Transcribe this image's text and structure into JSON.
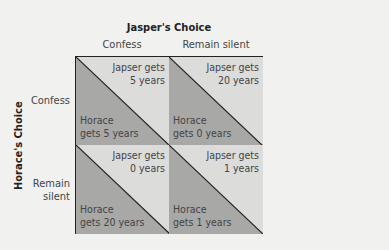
{
  "title": "Jasper's Choice",
  "row_title": "Horace's Choice",
  "columns": [
    "Confess",
    "Remain silent"
  ],
  "rows": [
    {
      "label_l1": "Confess",
      "label_l2": ""
    },
    {
      "label_l1": "Remain",
      "label_l2": "silent"
    }
  ],
  "colors": {
    "light": "#dcdcdb",
    "dark": "#a8a8a7",
    "line": "#222222"
  },
  "cells": [
    {
      "j1": "Japser gets",
      "j2": "5 years",
      "h1": "Horace",
      "h2": "gets 5 years"
    },
    {
      "j1": "Japser gets",
      "j2": "20 years",
      "h1": "Horace",
      "h2": "gets 0 years"
    },
    {
      "j1": "Japser gets",
      "j2": "0 years",
      "h1": "Horace",
      "h2": "gets 20 years"
    },
    {
      "j1": "Japser gets",
      "j2": "1 years",
      "h1": "Horace",
      "h2": "gets 1 years"
    }
  ]
}
